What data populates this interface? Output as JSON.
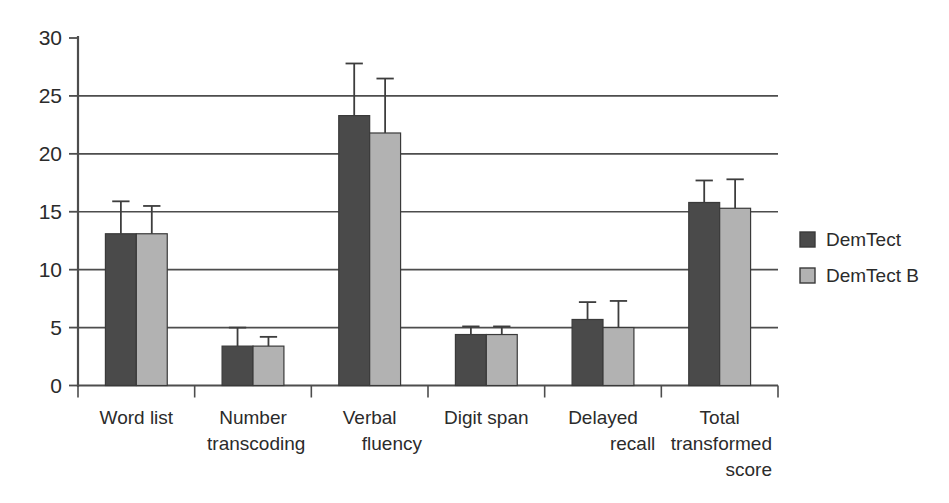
{
  "chart_data": {
    "type": "bar",
    "title": "",
    "subtitle": "",
    "xlabel": "",
    "ylabel": "",
    "ylim": [
      0,
      30
    ],
    "yticks": [
      0,
      5,
      10,
      15,
      20,
      25,
      30
    ],
    "ytick_labels": [
      "0",
      "5",
      "10",
      "15",
      "20",
      "25",
      "30"
    ],
    "grid": "horizontal",
    "legend_position": "right",
    "error_bars": "upper-only",
    "categories": [
      "Word list",
      "Number transcoding",
      "Verbal fluency",
      "Digit span",
      "Delayed recall",
      "Total transformed score"
    ],
    "category_lines": [
      [
        "Word list"
      ],
      [
        "Number",
        "transcoding"
      ],
      [
        "Verbal",
        "fluency"
      ],
      [
        "Digit span"
      ],
      [
        "Delayed",
        "recall"
      ],
      [
        "Total",
        "transformed",
        "score"
      ]
    ],
    "series": [
      {
        "name": "DemTect",
        "color": "#4a4a4a",
        "values": [
          13.1,
          3.4,
          23.3,
          4.4,
          5.7,
          15.8
        ],
        "errors_upper": [
          2.8,
          1.6,
          4.5,
          0.7,
          1.5,
          1.9
        ]
      },
      {
        "name": "DemTect B",
        "color": "#b2b2b2",
        "values": [
          13.1,
          3.4,
          21.8,
          4.4,
          5.0,
          15.3
        ],
        "errors_upper": [
          2.4,
          0.8,
          4.7,
          0.7,
          2.3,
          2.5
        ]
      }
    ]
  },
  "legend": {
    "items": [
      {
        "label": "DemTect",
        "color": "#4a4a4a"
      },
      {
        "label": "DemTect B",
        "color": "#b2b2b2"
      }
    ]
  },
  "colors": {
    "series_dark": "#4a4a4a",
    "series_light": "#b2b2b2",
    "axis": "#4d4d4d",
    "text": "#2b2b2b",
    "background": "#ffffff"
  }
}
